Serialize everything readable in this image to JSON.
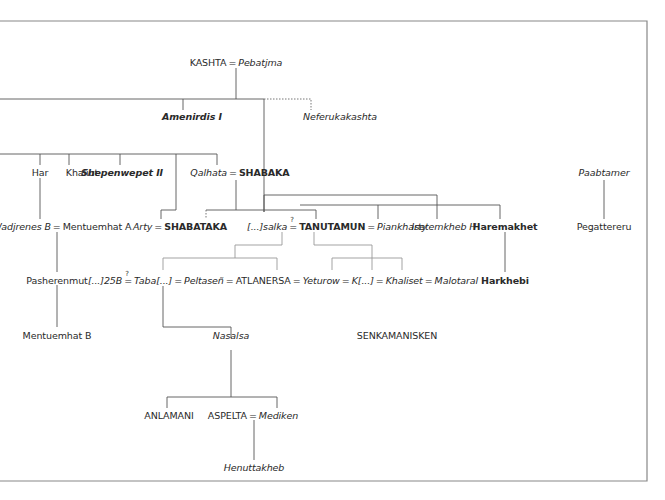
{
  "diagram": {
    "type": "family-tree",
    "nodes": {
      "kashta": "KASHTA",
      "pebatjma": "Pebatjma",
      "amenirdis": "Amenirdis I",
      "neferukakashta": "Neferukakashta",
      "har": "Har",
      "khaliut": "Khaliut",
      "shepenwepet": "Shepenwepet II",
      "qalhata": "Qalhata",
      "shabaka": "SHABAKA",
      "paabtamer": "Paabtamer",
      "wadjrenes": "Wadjrenes B",
      "mentuemhat_a": "Mentuemhat A",
      "arty": "Arty",
      "shabataka": "SHABATAKA",
      "salka": "[...]salka",
      "tanutamun": "TANUTAMUN",
      "piankharty": "Piankharty",
      "isetemkheb": "Isetemkheb H",
      "haremakhet": "Haremakhet",
      "pegattereru": "Pegattereru",
      "pasherenmut": "Pasherenmut",
      "n25b": "[...]25B",
      "taba": "Taba[...]",
      "peltasen": "Peltaseñ",
      "atlanersa": "ATLANERSA",
      "yeturow": "Yeturow",
      "k": "K[...]",
      "khaliset": "Khaliset",
      "malotaral": "Malotaral",
      "harkhebi": "Harkhebi",
      "mentuemhat_b": "Mentuemhat B",
      "nasalsa": "Nasalsa",
      "senkamanisken": "SENKAMANISKEN",
      "anlamani": "ANLAMANI",
      "aspelta": "ASPELTA",
      "mediken": "Mediken",
      "henuttakheb": "Henuttakheb"
    },
    "symbols": {
      "marriage": "=",
      "uncertain_marriage": "=",
      "question": "?"
    }
  }
}
